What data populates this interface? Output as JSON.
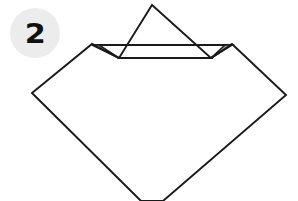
{
  "diagram": {
    "step_badge": {
      "number": "2",
      "shape": "circle",
      "fill_color": "#ececec",
      "text_color": "#111111"
    },
    "colors": {
      "background": "#ffffff",
      "stroke": "#1a1a1a",
      "paper_fill": "#ffffff",
      "flap_fill": "#a8a8a8",
      "badge_fill": "#ececec"
    },
    "stroke_width": 1.9,
    "shapes": [
      {
        "name": "paper-body",
        "label": "Diamond shaped paper body",
        "type": "polygon",
        "fill": "#ffffff",
        "stroke": "#1a1a1a",
        "points": "32,93 92,44 119,58 211,58 232,44 286,95 152,201 152,201"
      },
      {
        "name": "folded-top-flap",
        "label": "Top corner folded down triangle",
        "type": "polygon",
        "fill": "#ffffff",
        "stroke": "#1a1a1a",
        "points": "152,5 211,58 119,58"
      },
      {
        "name": "left-gray-flap",
        "label": "Left small gray triangular flap",
        "type": "polygon",
        "fill": "#a8a8a8",
        "stroke": "#1a1a1a",
        "points": "92,44 119,58 106,58"
      },
      {
        "name": "right-gray-flap",
        "label": "Right small gray triangular flap",
        "type": "polygon",
        "fill": "#a8a8a8",
        "stroke": "#1a1a1a",
        "points": "232,44 211,58 224,58"
      }
    ],
    "lines": [
      {
        "name": "left-fold-edge",
        "label": "Left fold crease edge",
        "x1": 92,
        "y1": 44,
        "x2": 119,
        "y2": 58
      },
      {
        "name": "right-fold-edge",
        "label": "Right fold crease edge",
        "x1": 232,
        "y1": 44,
        "x2": 211,
        "y2": 58
      },
      {
        "name": "horizontal-fold-line",
        "label": "Horizontal fold baseline",
        "x1": 92,
        "y1": 45,
        "x2": 232,
        "y2": 45
      }
    ]
  }
}
